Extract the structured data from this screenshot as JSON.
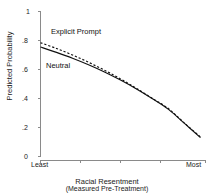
{
  "chart_data": {
    "type": "line",
    "title": "",
    "xlabel": "Racial Resentment",
    "xsublabel": "(Measured Pre-Treatment)",
    "ylabel": "Predicted Probability",
    "ylim": [
      0,
      1
    ],
    "xlim": [
      0,
      1
    ],
    "grid": false,
    "legend_position": "inline-annotations",
    "yticks": [
      "0",
      ".2",
      ".4",
      ".6",
      ".8",
      "1"
    ],
    "ytickvalues": [
      0,
      0.2,
      0.4,
      0.6,
      0.8,
      1
    ],
    "xticklabels": [
      "Least",
      "Most"
    ],
    "xtickvalues": [
      0,
      0.25,
      0.5,
      0.75,
      1
    ],
    "series": [
      {
        "name": "Explicit Prompt",
        "style": "dashed",
        "color": "#111111",
        "x": [
          0,
          0.1,
          0.2,
          0.3,
          0.4,
          0.5,
          0.6,
          0.7,
          0.8,
          0.9,
          1
        ],
        "values": [
          0.785,
          0.745,
          0.7,
          0.65,
          0.595,
          0.535,
          0.47,
          0.4,
          0.33,
          0.23,
          0.135
        ]
      },
      {
        "name": "Neutral",
        "style": "solid",
        "color": "#111111",
        "x": [
          0,
          0.1,
          0.2,
          0.3,
          0.4,
          0.5,
          0.6,
          0.7,
          0.8,
          0.9,
          1
        ],
        "values": [
          0.755,
          0.718,
          0.678,
          0.633,
          0.583,
          0.527,
          0.466,
          0.398,
          0.325,
          0.228,
          0.13
        ]
      }
    ],
    "annotations": [
      {
        "text": "Explicit Prompt",
        "x": 0.145,
        "y": 0.795
      },
      {
        "text": "Neutral",
        "x": 0.115,
        "y": 0.6
      }
    ]
  }
}
